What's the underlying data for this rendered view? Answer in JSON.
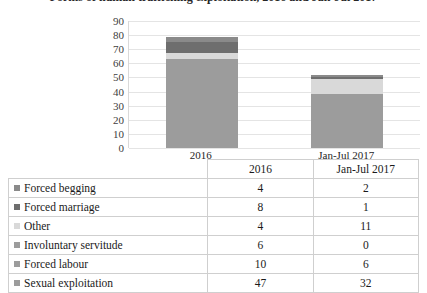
{
  "title": "Forms of human trafficking exploitation, 2016 and Jan-Jul 2017",
  "chart_data": {
    "type": "bar",
    "stacked": true,
    "title": "",
    "xlabel": "",
    "ylabel": "",
    "ylim": [
      0,
      90
    ],
    "yticks": [
      "0",
      "10",
      "20",
      "30",
      "40",
      "50",
      "60",
      "70",
      "80",
      "90"
    ],
    "grid": true,
    "legend_position": "bottom-table",
    "categories": [
      "2016",
      "Jan-Jul 2017"
    ],
    "series": [
      {
        "name": "Sexual exploitation",
        "values": [
          47,
          32
        ],
        "color": "#9c9c9c"
      },
      {
        "name": "Forced labour",
        "values": [
          10,
          6
        ],
        "color": "#9c9c9c"
      },
      {
        "name": "Involuntary servitude",
        "values": [
          6,
          0
        ],
        "color": "#9c9c9c"
      },
      {
        "name": "Other",
        "values": [
          4,
          11
        ],
        "color": "#d9d9d9"
      },
      {
        "name": "Forced marriage",
        "values": [
          8,
          1
        ],
        "color": "#6e6e6e"
      },
      {
        "name": "Forced begging",
        "values": [
          4,
          2
        ],
        "color": "#8a8a8a"
      }
    ],
    "totals": [
      79,
      52
    ]
  },
  "table": {
    "header": {
      "label": "",
      "columns": [
        "2016",
        "Jan-Jul 2017"
      ]
    },
    "rows": [
      {
        "label": "Forced begging",
        "swatch": "#8a8a8a",
        "v2016": "4",
        "v2017": "2"
      },
      {
        "label": "Forced marriage",
        "swatch": "#6e6e6e",
        "v2016": "8",
        "v2017": "1"
      },
      {
        "label": "Other",
        "swatch": "#d9d9d9",
        "v2016": "4",
        "v2017": "11"
      },
      {
        "label": "Involuntary servitude",
        "swatch": "#9c9c9c",
        "v2016": "6",
        "v2017": "0"
      },
      {
        "label": "Forced labour",
        "swatch": "#9c9c9c",
        "v2016": "10",
        "v2017": "6"
      },
      {
        "label": "Sexual exploitation",
        "swatch": "#9c9c9c",
        "v2016": "47",
        "v2017": "32"
      }
    ]
  }
}
